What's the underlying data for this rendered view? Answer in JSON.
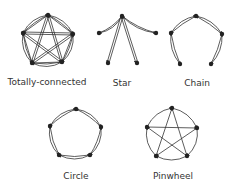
{
  "diagrams": [
    {
      "label": "Totally-connected",
      "label_pos": [
        47,
        77
      ],
      "nodes": [
        [
          48,
          15
        ],
        [
          73,
          34
        ],
        [
          62,
          62
        ],
        [
          32,
          63
        ],
        [
          23,
          33
        ]
      ],
      "type": "complete"
    },
    {
      "label": "Star",
      "label_pos": [
        122,
        78
      ],
      "nodes": [
        [
          122,
          16
        ],
        [
          156,
          33
        ],
        [
          137,
          63
        ],
        [
          108,
          63
        ],
        [
          99,
          33
        ]
      ],
      "type": "star"
    },
    {
      "label": "Chain",
      "label_pos": [
        197,
        78
      ],
      "nodes": [
        [
          196,
          16
        ],
        [
          222,
          34
        ],
        [
          211,
          64
        ],
        [
          180,
          64
        ],
        [
          171,
          33
        ]
      ],
      "type": "chain"
    },
    {
      "label": "Circle",
      "label_pos": [
        76,
        171
      ],
      "nodes": [
        [
          76,
          109
        ],
        [
          101,
          127
        ],
        [
          90,
          155
        ],
        [
          59,
          155
        ],
        [
          50,
          126
        ]
      ],
      "type": "circle"
    },
    {
      "label": "Pinwheel",
      "label_pos": [
        173,
        171
      ],
      "nodes": [
        [
          172,
          108
        ],
        [
          197,
          128
        ],
        [
          187,
          156
        ],
        [
          156,
          156
        ],
        [
          147,
          127
        ]
      ],
      "type": "pinwheel"
    }
  ],
  "colors": {
    "ink": "#333333"
  }
}
